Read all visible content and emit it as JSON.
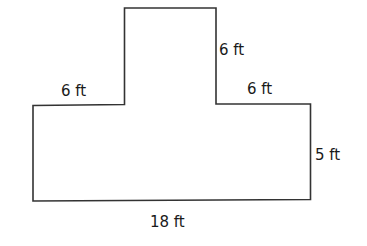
{
  "diagram": {
    "type": "composite-rectangle",
    "stroke_color": "#333333",
    "labels": {
      "top_box_height": "6 ft",
      "left_shelf_width": "6 ft",
      "right_shelf_width": "6 ft",
      "right_side_height": "5 ft",
      "bottom_width": "18 ft"
    }
  }
}
